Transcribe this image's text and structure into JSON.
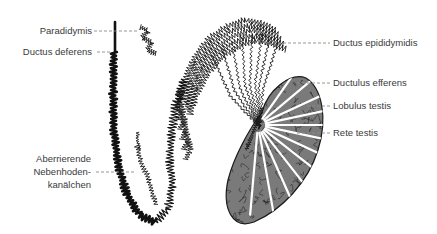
{
  "figure": {
    "colors": {
      "ink": "#111111",
      "label_text": "#3a3a3a",
      "leader_line": "#8a8a8a",
      "background": "#ffffff"
    },
    "labels_left": [
      {
        "id": "paradidymis",
        "lines": [
          "Paradidymis"
        ]
      },
      {
        "id": "ductus-deferens",
        "lines": [
          "Ductus deferens"
        ]
      },
      {
        "id": "aberrierende",
        "lines": [
          "Aberrierende",
          "Nebenhoden-",
          "kanälchen"
        ]
      }
    ],
    "labels_right": [
      {
        "id": "ductus-epididymidis",
        "lines": [
          "Ductus epididymidis"
        ]
      },
      {
        "id": "ductulus-efferens",
        "lines": [
          "Ductulus efferens"
        ]
      },
      {
        "id": "lobulus-testis",
        "lines": [
          "Lobulus testis"
        ]
      },
      {
        "id": "rete-testis",
        "lines": [
          "Rete testis"
        ]
      }
    ],
    "structures": [
      "ductus-deferens",
      "paradidymis",
      "aberrant-ductules",
      "ductus-epididymidis",
      "ductuli-efferentes",
      "testis",
      "rete-testis",
      "lobuli-testis"
    ]
  }
}
